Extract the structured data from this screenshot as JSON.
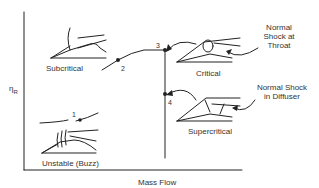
{
  "diagram": {
    "axes": {
      "y_label": "η",
      "y_label_subscript": "R",
      "x_label": "Mass Flow"
    },
    "points": [
      {
        "id": "1",
        "label": "1"
      },
      {
        "id": "2",
        "label": "2"
      },
      {
        "id": "3",
        "label": "3"
      },
      {
        "id": "4",
        "label": "4"
      }
    ],
    "regimes": {
      "subcritical": "Subcritical",
      "critical": "Critical",
      "supercritical": "Supercritical",
      "unstable": "Unstable (Buzz)"
    },
    "annotations": {
      "throat_line1": "Normal",
      "throat_line2": "Shock at",
      "throat_line3": "Throat",
      "diffuser_line1": "Normal Shock",
      "diffuser_line2": "in Diffuser"
    },
    "colors": {
      "ink": "#222222",
      "background": "#ffffff"
    }
  }
}
